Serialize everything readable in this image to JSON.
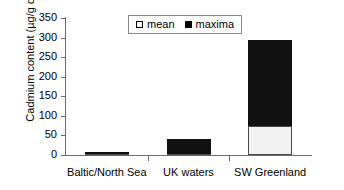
{
  "chart_data": {
    "type": "bar",
    "stacked": true,
    "title": "",
    "xlabel": "",
    "ylabel": "Cadmium content (µg/g dw)",
    "categories": [
      "Baltic/North Sea",
      "UK waters",
      "SW Greenland"
    ],
    "series": [
      {
        "name": "mean",
        "values": [
          2,
          3,
          73
        ],
        "color": "#f2f2f2"
      },
      {
        "name": "maxima",
        "values": [
          8,
          40,
          295
        ],
        "color": "#111111"
      }
    ],
    "ylim": [
      0,
      350
    ],
    "yticks": [
      0,
      50,
      100,
      150,
      200,
      250,
      300,
      350
    ],
    "ytick_labels": [
      "0",
      "50",
      "100",
      "150",
      "200",
      "250",
      "300",
      "350"
    ],
    "grid": false,
    "legend_position": "top-center"
  },
  "legend": {
    "entries": [
      {
        "label": "mean",
        "marker": "hollow-square"
      },
      {
        "label": "maxima",
        "marker": "filled-square"
      }
    ]
  },
  "axes": {
    "y_title": "Cadmium content (µg/g dw)",
    "y_tick_labels": [
      "350",
      "300",
      "250",
      "200",
      "150",
      "100",
      "50",
      "0"
    ],
    "x_tick_labels": [
      "Baltic/North Sea",
      "UK waters",
      "SW Greenland"
    ]
  }
}
